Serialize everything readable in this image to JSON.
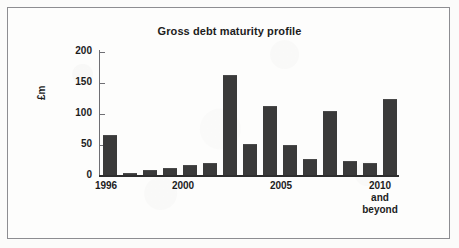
{
  "chart_data": {
    "type": "bar",
    "title": "Gross debt maturity profile",
    "xlabel": "",
    "ylabel": "£m",
    "ylim": [
      0,
      200
    ],
    "ytick_labels": [
      "200",
      "150",
      "100",
      "50",
      "0"
    ],
    "ytick_values": [
      200,
      150,
      100,
      50,
      0
    ],
    "grid": false,
    "legend": "none",
    "bar_color": "#3a3a3a",
    "categories": [
      "1996",
      "1997",
      "1998",
      "1999",
      "2000",
      "2001",
      "2002",
      "2003",
      "2004",
      "2005",
      "2006",
      "2007",
      "2008",
      "2009",
      "2010 and beyond"
    ],
    "values": [
      65,
      4,
      8,
      11,
      17,
      20,
      163,
      51,
      113,
      48,
      26,
      104,
      23,
      20,
      124
    ],
    "visible_xtick_labels": [
      {
        "text": "1996",
        "category_index": 0
      },
      {
        "text": "2000",
        "category_index": 4
      },
      {
        "text": "2005",
        "category_index": 9
      },
      {
        "text": "2010\nand\nbeyond",
        "category_index": 14
      }
    ]
  },
  "chart": {
    "title": "Gross debt maturity profile",
    "y_axis_title": "£m",
    "ytick_200": "200",
    "ytick_150": "150",
    "ytick_100": "100",
    "ytick_50": "50",
    "ytick_0": "0",
    "xlabel_1996": "1996",
    "xlabel_2000": "2000",
    "xlabel_2005": "2005",
    "xlabel_2010": "2010\nand\nbeyond"
  }
}
